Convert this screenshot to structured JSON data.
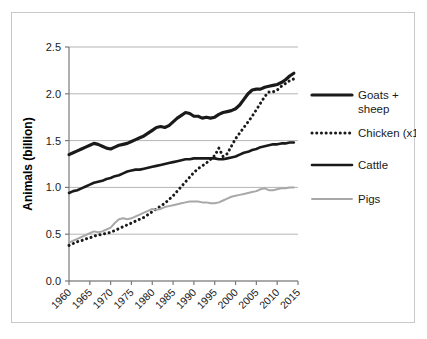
{
  "figure": {
    "border_color": "#c9c9c9",
    "background": "#ffffff"
  },
  "chart_data": {
    "type": "line",
    "title": "",
    "xlabel": "",
    "ylabel": "Animals (billion)",
    "xlim": [
      1960,
      2015
    ],
    "ylim": [
      0.0,
      2.5
    ],
    "grid": "horizontal",
    "legend_position": "right",
    "ytick_labels": [
      "0.0",
      "0.5",
      "1.0",
      "1.5",
      "2.0",
      "2.5"
    ],
    "ytick_values": [
      0.0,
      0.5,
      1.0,
      1.5,
      2.0,
      2.5
    ],
    "xtick_labels": [
      "1960",
      "1965",
      "1970",
      "1975",
      "1980",
      "1985",
      "1990",
      "1995",
      "2000",
      "2005",
      "2010",
      "2015"
    ],
    "xtick_values": [
      1960,
      1965,
      1970,
      1975,
      1980,
      1985,
      1990,
      1995,
      2000,
      2005,
      2010,
      2015
    ],
    "x": [
      1960,
      1961,
      1962,
      1963,
      1964,
      1965,
      1966,
      1967,
      1968,
      1969,
      1970,
      1971,
      1972,
      1973,
      1974,
      1975,
      1976,
      1977,
      1978,
      1979,
      1980,
      1981,
      1982,
      1983,
      1984,
      1985,
      1986,
      1987,
      1988,
      1989,
      1990,
      1991,
      1992,
      1993,
      1994,
      1995,
      1996,
      1997,
      1998,
      1999,
      2000,
      2001,
      2002,
      2003,
      2004,
      2005,
      2006,
      2007,
      2008,
      2009,
      2010,
      2011,
      2012,
      2013,
      2014
    ],
    "series": [
      {
        "name": "Goats + sheep",
        "color": "#1a1a1a",
        "style": "solid",
        "width": 3.2,
        "values": [
          1.35,
          1.37,
          1.39,
          1.41,
          1.43,
          1.45,
          1.47,
          1.46,
          1.44,
          1.42,
          1.41,
          1.43,
          1.45,
          1.46,
          1.47,
          1.49,
          1.51,
          1.53,
          1.55,
          1.58,
          1.61,
          1.64,
          1.65,
          1.64,
          1.66,
          1.7,
          1.74,
          1.77,
          1.8,
          1.79,
          1.76,
          1.76,
          1.74,
          1.75,
          1.74,
          1.75,
          1.78,
          1.8,
          1.81,
          1.82,
          1.84,
          1.88,
          1.94,
          2.0,
          2.04,
          2.05,
          2.05,
          2.07,
          2.08,
          2.09,
          2.1,
          2.12,
          2.15,
          2.19,
          2.22
        ]
      },
      {
        "name": "Chicken (x10)",
        "color": "#1a1a1a",
        "style": "dotted",
        "width": 3.0,
        "values": [
          0.38,
          0.4,
          0.42,
          0.43,
          0.45,
          0.46,
          0.48,
          0.49,
          0.5,
          0.51,
          0.52,
          0.54,
          0.56,
          0.58,
          0.6,
          0.62,
          0.64,
          0.66,
          0.68,
          0.71,
          0.74,
          0.77,
          0.8,
          0.83,
          0.87,
          0.91,
          0.96,
          1.01,
          1.06,
          1.11,
          1.16,
          1.2,
          1.23,
          1.26,
          1.3,
          1.34,
          1.42,
          1.33,
          1.36,
          1.44,
          1.52,
          1.58,
          1.64,
          1.7,
          1.76,
          1.83,
          1.9,
          1.97,
          2.02,
          2.02,
          2.04,
          2.08,
          2.11,
          2.14,
          2.16
        ]
      },
      {
        "name": "Cattle",
        "color": "#1a1a1a",
        "style": "solid",
        "width": 2.6,
        "values": [
          0.94,
          0.96,
          0.97,
          0.99,
          1.01,
          1.03,
          1.05,
          1.06,
          1.07,
          1.09,
          1.1,
          1.12,
          1.13,
          1.15,
          1.17,
          1.18,
          1.19,
          1.19,
          1.2,
          1.21,
          1.22,
          1.23,
          1.24,
          1.25,
          1.26,
          1.27,
          1.28,
          1.29,
          1.3,
          1.3,
          1.31,
          1.31,
          1.31,
          1.31,
          1.31,
          1.31,
          1.3,
          1.3,
          1.31,
          1.32,
          1.33,
          1.35,
          1.37,
          1.38,
          1.4,
          1.41,
          1.43,
          1.44,
          1.45,
          1.46,
          1.46,
          1.47,
          1.47,
          1.48,
          1.48
        ]
      },
      {
        "name": "Pigs",
        "color": "#a8a8a8",
        "style": "solid",
        "width": 2.0,
        "values": [
          0.41,
          0.43,
          0.45,
          0.47,
          0.49,
          0.51,
          0.53,
          0.52,
          0.53,
          0.55,
          0.57,
          0.62,
          0.66,
          0.67,
          0.66,
          0.67,
          0.69,
          0.71,
          0.73,
          0.75,
          0.77,
          0.76,
          0.77,
          0.79,
          0.8,
          0.81,
          0.82,
          0.83,
          0.84,
          0.85,
          0.85,
          0.85,
          0.84,
          0.84,
          0.83,
          0.83,
          0.84,
          0.86,
          0.88,
          0.9,
          0.91,
          0.92,
          0.93,
          0.94,
          0.95,
          0.96,
          0.98,
          0.99,
          0.97,
          0.97,
          0.98,
          0.99,
          0.99,
          1.0,
          1.0
        ]
      }
    ]
  },
  "legend": {
    "entries": [
      {
        "label": "Goats + sheep",
        "key": "goats-sheep"
      },
      {
        "label": "Chicken (x10)",
        "key": "chicken"
      },
      {
        "label": "Cattle",
        "key": "cattle"
      },
      {
        "label": "Pigs",
        "key": "pigs"
      }
    ]
  }
}
